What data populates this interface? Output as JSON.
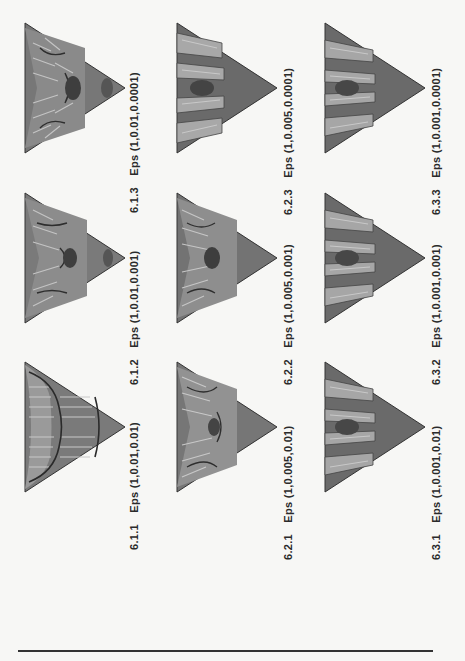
{
  "figure": {
    "orientation": "rotated-90-ccw",
    "panels": [
      {
        "id": "6.1.1",
        "label": "Eps",
        "params": "(1,0.01,0.01)",
        "style": "wavy"
      },
      {
        "id": "6.1.2",
        "label": "Eps",
        "params": "(1,0.01,0.001)",
        "style": "mixed"
      },
      {
        "id": "6.1.3",
        "label": "Eps",
        "params": "(1,0.01,0.0001)",
        "style": "mixed"
      },
      {
        "id": "6.2.1",
        "label": "Eps",
        "params": "(1,0.005,0.01)",
        "style": "mixed"
      },
      {
        "id": "6.2.2",
        "label": "Eps",
        "params": "(1,0.005,0.001)",
        "style": "mixed"
      },
      {
        "id": "6.2.3",
        "label": "Eps",
        "params": "(1,0.005,0.0001)",
        "style": "peaks"
      },
      {
        "id": "6.3.1",
        "label": "Eps",
        "params": "(1,0.001,0.01)",
        "style": "peaks"
      },
      {
        "id": "6.3.2",
        "label": "Eps",
        "params": "(1,0.001,0.001)",
        "style": "peaks"
      },
      {
        "id": "6.3.3",
        "label": "Eps",
        "params": "(1,0.001,0.0001)",
        "style": "peaks"
      }
    ],
    "colors": {
      "base": "#6e6e6e",
      "light": "#b5b5b5",
      "dark": "#3a3a3a",
      "paper": "#f7f7f5"
    }
  }
}
